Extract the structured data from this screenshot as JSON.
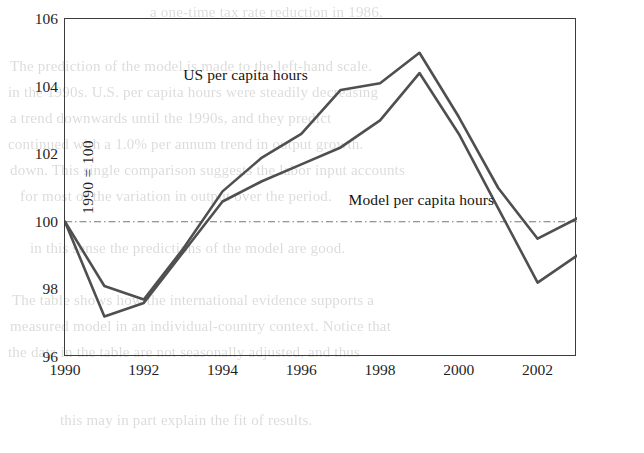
{
  "page": {
    "background_color": "#ffffff",
    "ghost_text_color": "#8c8c86",
    "ghost_lines": [
      "a one-time tax rate reduction in 1986.",
      "The prediction of the model is made to the left-hand scale.",
      "in the 1990s. U.S. per capita hours were steadily decreasing",
      "a trend downwards until the 1990s, and they predict",
      "continued with a 1.0% per annum trend in output growth.",
      "down. This single comparison suggests the labor input accounts",
      "for most of the variation in output over the period.",
      "in this sense the predictions of the model are good.",
      "The table shows how the international evidence supports a",
      "measured model in an individual-country context. Notice that",
      "the data in the table are not seasonally adjusted, and thus",
      "this may in part explain the fit of results."
    ]
  },
  "chart_data": {
    "type": "line",
    "title": "",
    "xlabel": "",
    "ylabel": "1990 = 100",
    "xlim": [
      1990,
      2003
    ],
    "ylim": [
      96,
      106
    ],
    "xticks": [
      1990,
      1992,
      1994,
      1996,
      1998,
      2000,
      2002
    ],
    "yticks": [
      96,
      98,
      100,
      102,
      104,
      106
    ],
    "grid": false,
    "reference_line": {
      "value": 100,
      "style": "dash-dot",
      "color": "#777777"
    },
    "line_color": "#4f4f4f",
    "legend_position": "inline-annotations",
    "series": [
      {
        "name": "US per capita hours",
        "label_x": 1993.0,
        "label_y": 104.35,
        "x": [
          1990,
          1991,
          1992,
          1993,
          1994,
          1995,
          1996,
          1997,
          1998,
          1999,
          2000,
          2001,
          2002,
          2003
        ],
        "values": [
          100.0,
          98.1,
          97.7,
          99.2,
          100.9,
          101.9,
          102.6,
          103.9,
          104.1,
          105.0,
          103.1,
          101.0,
          99.5,
          100.1
        ]
      },
      {
        "name": "Model per capita hours",
        "label_x": 1997.2,
        "label_y": 100.65,
        "x": [
          1990,
          1991,
          1992,
          1993,
          1994,
          1995,
          1996,
          1997,
          1998,
          1999,
          2000,
          2001,
          2002,
          2003
        ],
        "values": [
          100.0,
          97.2,
          97.6,
          99.1,
          100.6,
          101.2,
          101.7,
          102.2,
          103.0,
          104.4,
          102.6,
          100.4,
          98.2,
          99.0
        ]
      }
    ]
  }
}
